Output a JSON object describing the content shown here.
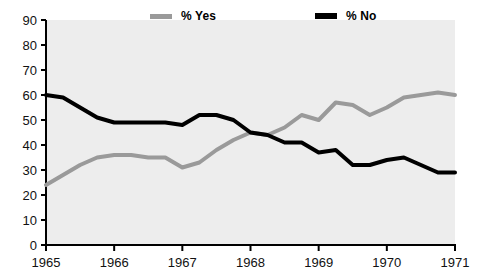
{
  "legend": {
    "position": "top",
    "entries": [
      {
        "label": "% Yes",
        "color": "#9a9a9a",
        "name": "legend-yes"
      },
      {
        "label": "% No",
        "color": "#000000",
        "name": "legend-no"
      }
    ]
  },
  "chart_data": {
    "type": "line",
    "title": "",
    "subtitle": "",
    "xlabel": "",
    "ylabel": "",
    "xlim": [
      1965,
      1971
    ],
    "ylim": [
      0,
      90
    ],
    "ytick_step": 10,
    "grid": false,
    "legend_position": "top",
    "xticks": [
      "1965",
      "1966",
      "1967",
      "1968",
      "1969",
      "1970",
      "1971"
    ],
    "yticks": [
      "0",
      "10",
      "20",
      "30",
      "40",
      "50",
      "60",
      "70",
      "80",
      "90"
    ],
    "x": [
      1965.0,
      1965.25,
      1965.5,
      1965.75,
      1966.0,
      1966.25,
      1966.5,
      1966.75,
      1967.0,
      1967.25,
      1967.5,
      1967.75,
      1968.0,
      1968.25,
      1968.5,
      1968.75,
      1969.0,
      1969.25,
      1969.5,
      1969.75,
      1970.0,
      1970.25,
      1970.5,
      1970.75,
      1971.0
    ],
    "series": [
      {
        "name": "% Yes",
        "color": "#9a9a9a",
        "width": 4,
        "values": [
          24,
          28,
          32,
          35,
          36,
          36,
          35,
          35,
          31,
          33,
          38,
          42,
          45,
          44,
          47,
          52,
          50,
          57,
          56,
          52,
          55,
          59,
          60,
          61,
          60
        ]
      },
      {
        "name": "% No",
        "color": "#000000",
        "width": 4,
        "values": [
          60,
          59,
          55,
          51,
          49,
          49,
          49,
          49,
          48,
          52,
          52,
          50,
          45,
          44,
          41,
          41,
          37,
          38,
          32,
          32,
          34,
          35,
          32,
          29,
          29
        ]
      }
    ]
  },
  "axes": {
    "plot_left": 46,
    "plot_right": 455,
    "plot_top": 20,
    "plot_bottom": 245,
    "background": "#ededed",
    "axis_color": "#000000"
  }
}
